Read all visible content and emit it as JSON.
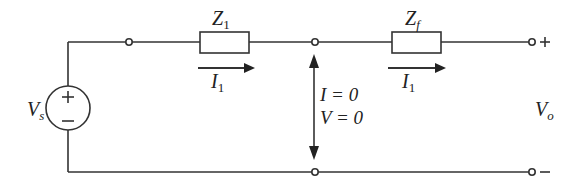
{
  "diagram": {
    "type": "circuit",
    "colors": {
      "wire": "#333333",
      "background": "#ffffff",
      "text": "#222222"
    },
    "source": {
      "label": "V",
      "subscript": "s",
      "plus": "+",
      "minus": "−"
    },
    "impedances": [
      {
        "label": "Z",
        "subscript": "1"
      },
      {
        "label": "Z",
        "subscript": "f"
      }
    ],
    "currents": [
      {
        "label": "I",
        "subscript": "1"
      },
      {
        "label": "I",
        "subscript": "1"
      }
    ],
    "virtual_short": {
      "line1": "I = 0",
      "line2": "V = 0"
    },
    "output": {
      "label": "V",
      "subscript": "o",
      "plus": "+",
      "minus": "−"
    }
  }
}
